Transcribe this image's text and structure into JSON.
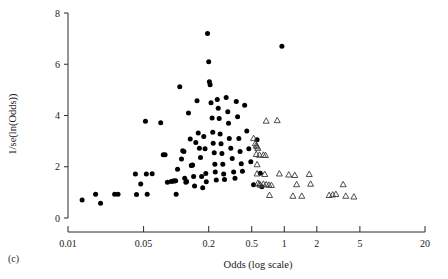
{
  "figure": {
    "panel_label": "(c)",
    "background": "#ffffff",
    "foreground": "#000000"
  },
  "axes": {
    "x": {
      "title": "Odds (log scale)",
      "scale": "log",
      "tick_labels": [
        "0.01",
        "0.05",
        "0.2",
        "0.5",
        "1",
        "2",
        "5",
        "20"
      ],
      "tick_values": [
        0.01,
        0.05,
        0.2,
        0.5,
        1,
        2,
        5,
        20
      ],
      "range": [
        0.01,
        20
      ]
    },
    "y": {
      "title": "1/se(ln(Odds))",
      "scale": "linear",
      "tick_labels": [
        "0",
        "2",
        "4",
        "6",
        "8"
      ],
      "tick_values": [
        0,
        2,
        4,
        6,
        8
      ],
      "range": [
        0,
        8
      ]
    }
  },
  "chart_data": {
    "type": "scatter",
    "title": "",
    "subtitle": "",
    "xlabel": "Odds (log scale)",
    "ylabel": "1/se(ln(Odds))",
    "xscale": "log",
    "xlim": [
      0.01,
      20
    ],
    "ylim": [
      0,
      8
    ],
    "grid": false,
    "legend": "none",
    "annotations": [
      "(c)"
    ],
    "series": [
      {
        "name": "published-studies",
        "marker": "filled-circle",
        "color": "#000000",
        "points": [
          [
            0.0135,
            0.7
          ],
          [
            0.018,
            0.93
          ],
          [
            0.02,
            0.58
          ],
          [
            0.027,
            0.93
          ],
          [
            0.029,
            0.93
          ],
          [
            0.042,
            1.72
          ],
          [
            0.043,
            0.92
          ],
          [
            0.047,
            1.33
          ],
          [
            0.052,
            3.78
          ],
          [
            0.053,
            1.72
          ],
          [
            0.054,
            0.93
          ],
          [
            0.06,
            1.73
          ],
          [
            0.072,
            3.72
          ],
          [
            0.076,
            2.47
          ],
          [
            0.079,
            2.47
          ],
          [
            0.083,
            1.4
          ],
          [
            0.09,
            1.42
          ],
          [
            0.094,
            1.44
          ],
          [
            0.096,
            1.44
          ],
          [
            0.099,
            1.45
          ],
          [
            0.1,
            0.93
          ],
          [
            0.103,
            1.9
          ],
          [
            0.108,
            5.12
          ],
          [
            0.112,
            2.3
          ],
          [
            0.115,
            2.62
          ],
          [
            0.118,
            2.6
          ],
          [
            0.12,
            1.55
          ],
          [
            0.123,
            1.4
          ],
          [
            0.125,
            1.42
          ],
          [
            0.13,
            4.1
          ],
          [
            0.135,
            3.08
          ],
          [
            0.138,
            2.05
          ],
          [
            0.14,
            2.06
          ],
          [
            0.142,
            2.07
          ],
          [
            0.145,
            1.62
          ],
          [
            0.148,
            1.25
          ],
          [
            0.152,
            2.95
          ],
          [
            0.156,
            4.58
          ],
          [
            0.16,
            3.32
          ],
          [
            0.164,
            2.72
          ],
          [
            0.168,
            2.36
          ],
          [
            0.172,
            1.62
          ],
          [
            0.176,
            1.18
          ],
          [
            0.18,
            3.18
          ],
          [
            0.185,
            2.7
          ],
          [
            0.188,
            1.74
          ],
          [
            0.19,
            1.41
          ],
          [
            0.195,
            7.2
          ],
          [
            0.2,
            6.1
          ],
          [
            0.203,
            5.32
          ],
          [
            0.206,
            5.2
          ],
          [
            0.21,
            4.5
          ],
          [
            0.215,
            3.9
          ],
          [
            0.218,
            3.35
          ],
          [
            0.22,
            2.92
          ],
          [
            0.225,
            2.55
          ],
          [
            0.228,
            2.1
          ],
          [
            0.23,
            1.8
          ],
          [
            0.235,
            1.48
          ],
          [
            0.24,
            4.62
          ],
          [
            0.245,
            4.28
          ],
          [
            0.25,
            3.88
          ],
          [
            0.255,
            3.28
          ],
          [
            0.26,
            2.9
          ],
          [
            0.265,
            2.52
          ],
          [
            0.27,
            2.1
          ],
          [
            0.275,
            1.72
          ],
          [
            0.28,
            1.5
          ],
          [
            0.29,
            4.7
          ],
          [
            0.3,
            4.15
          ],
          [
            0.305,
            3.7
          ],
          [
            0.31,
            3.1
          ],
          [
            0.32,
            2.72
          ],
          [
            0.33,
            2.32
          ],
          [
            0.34,
            1.8
          ],
          [
            0.35,
            1.55
          ],
          [
            0.36,
            4.55
          ],
          [
            0.37,
            3.95
          ],
          [
            0.38,
            3.1
          ],
          [
            0.39,
            2.6
          ],
          [
            0.4,
            2.12
          ],
          [
            0.41,
            1.82
          ],
          [
            0.43,
            4.4
          ],
          [
            0.45,
            3.4
          ],
          [
            0.47,
            2.7
          ],
          [
            0.49,
            2.2
          ],
          [
            0.52,
            1.3
          ],
          [
            0.56,
            3.05
          ],
          [
            0.6,
            1.75
          ],
          [
            0.62,
            1.22
          ],
          [
            0.95,
            6.7
          ]
        ]
      },
      {
        "name": "unpublished-studies",
        "marker": "open-triangle",
        "color": "#3a3a3a",
        "points": [
          [
            0.52,
            3.1
          ],
          [
            0.54,
            2.9
          ],
          [
            0.55,
            2.82
          ],
          [
            0.56,
            2.78
          ],
          [
            0.57,
            2.72
          ],
          [
            0.55,
            2.48
          ],
          [
            0.59,
            2.45
          ],
          [
            0.56,
            2.08
          ],
          [
            0.56,
            1.72
          ],
          [
            0.57,
            1.35
          ],
          [
            0.59,
            1.32
          ],
          [
            0.6,
            1.28
          ],
          [
            0.64,
            2.45
          ],
          [
            0.67,
            2.44
          ],
          [
            0.68,
            3.78
          ],
          [
            0.66,
            1.7
          ],
          [
            0.64,
            1.32
          ],
          [
            0.68,
            1.3
          ],
          [
            0.72,
            1.28
          ],
          [
            0.76,
            1.27
          ],
          [
            0.73,
            0.88
          ],
          [
            0.86,
            3.8
          ],
          [
            0.9,
            1.72
          ],
          [
            1.1,
            1.68
          ],
          [
            1.25,
            1.66
          ],
          [
            1.3,
            1.3
          ],
          [
            1.2,
            0.85
          ],
          [
            1.45,
            0.85
          ],
          [
            1.7,
            1.7
          ],
          [
            1.75,
            1.32
          ],
          [
            2.6,
            0.88
          ],
          [
            2.8,
            0.9
          ],
          [
            3.0,
            0.92
          ],
          [
            3.5,
            1.3
          ],
          [
            3.7,
            0.85
          ],
          [
            4.4,
            0.82
          ]
        ]
      }
    ]
  }
}
